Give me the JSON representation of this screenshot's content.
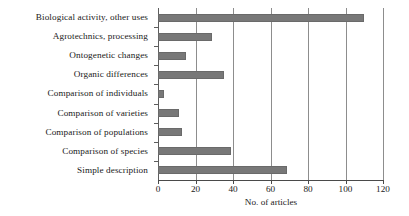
{
  "chart_data": {
    "type": "bar",
    "orientation": "horizontal",
    "title": "",
    "xlabel": "No. of articles",
    "ylabel": "",
    "xlim": [
      0,
      120
    ],
    "xticks": [
      0,
      20,
      40,
      60,
      80,
      100,
      120
    ],
    "grid": "vertical",
    "legend": "none",
    "bar_color": "#787878",
    "categories": [
      "Biological activity, other uses",
      "Agrotechnics, processing",
      "Ontogenetic changes",
      "Organic differences",
      "Comparison of individuals",
      "Comparison of varieties",
      "Comparison of populations",
      "Comparison of species",
      "Simple description"
    ],
    "values": [
      110,
      29,
      15,
      35,
      3,
      11,
      13,
      39,
      69
    ]
  }
}
